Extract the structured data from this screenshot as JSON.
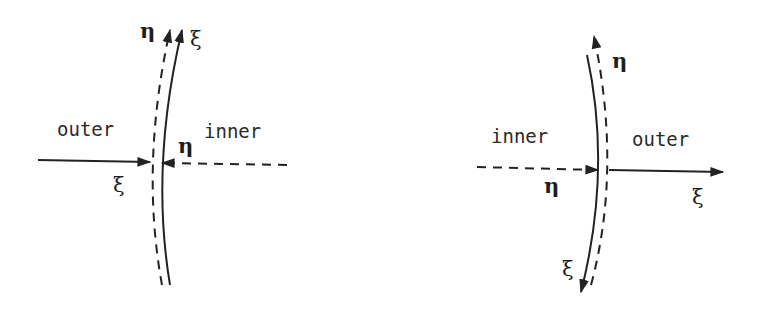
{
  "diagrams": [
    {
      "id": "left",
      "regions": {
        "left": "outer",
        "right": "inner"
      },
      "labels": {
        "boundary_dashed_top": "η",
        "boundary_solid_top": "ξ",
        "horizontal_solid": "ξ",
        "horizontal_dashed": "η"
      }
    },
    {
      "id": "right",
      "regions": {
        "left": "inner",
        "right": "outer"
      },
      "labels": {
        "boundary_dashed_top": "η",
        "boundary_solid_bottom": "ξ",
        "horizontal_dashed": "η",
        "horizontal_solid": "ξ"
      }
    }
  ],
  "colors": {
    "ink": "#222222",
    "background": "#ffffff"
  }
}
